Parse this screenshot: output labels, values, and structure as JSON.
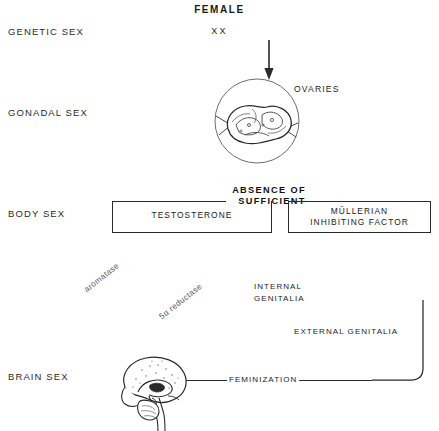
{
  "figure": {
    "title": "FEMALE",
    "karyotype": "XX"
  },
  "rows": [
    {
      "id": "genetic-sex",
      "label": "GENETIC SEX"
    },
    {
      "id": "gonadal-sex",
      "label": "GONADAL SEX"
    },
    {
      "id": "body-sex",
      "label": "BODY SEX"
    },
    {
      "id": "brain-sex",
      "label": "BRAIN SEX"
    }
  ],
  "gonad": {
    "label": "OVARIES",
    "illustration": "ovaries-illustration"
  },
  "bracket": {
    "line1": "ABSENCE OF",
    "line2": "SUFFICIENT"
  },
  "boxes": [
    {
      "id": "testosterone",
      "text": "TESTOSTERONE"
    },
    {
      "id": "mullerian-inhibiting-factor",
      "line1": "MÜLLERIAN",
      "line2": "INHIBITING  FACTOR"
    }
  ],
  "enzymes": [
    {
      "id": "aromatase",
      "label": "aromatase"
    },
    {
      "id": "5a-reductase",
      "label": "5α reductase"
    }
  ],
  "outcomes": [
    {
      "id": "internal-genitalia",
      "line1": "INTERNAL",
      "line2": "GENITALIA"
    },
    {
      "id": "external-genitalia",
      "text": "EXTERNAL  GENITALIA"
    }
  ],
  "brain": {
    "illustration": "brain-illustration",
    "connector_label": "FEMINIZATION"
  },
  "colors": {
    "ink": "#2a2a2a",
    "text": "#242424",
    "faint": "#5a5a5a",
    "background": "#ffffff"
  }
}
